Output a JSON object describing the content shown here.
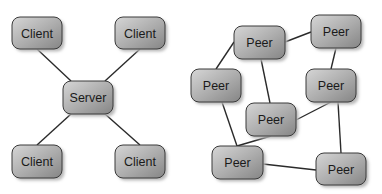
{
  "diagrams": [
    {
      "id": "client-server",
      "type": "star network",
      "nodes": [
        {
          "id": "client-tl",
          "label": "Client",
          "x": 12,
          "y": 17,
          "w": 50,
          "h": 32
        },
        {
          "id": "client-tr",
          "label": "Client",
          "x": 115,
          "y": 17,
          "w": 50,
          "h": 32
        },
        {
          "id": "server",
          "label": "Server",
          "x": 63,
          "y": 81,
          "w": 50,
          "h": 33
        },
        {
          "id": "client-bl",
          "label": "Client",
          "x": 12,
          "y": 145,
          "w": 50,
          "h": 33
        },
        {
          "id": "client-br",
          "label": "Client",
          "x": 115,
          "y": 145,
          "w": 50,
          "h": 33
        }
      ],
      "edges": [
        {
          "from": "client-tl",
          "to": "server",
          "x1": 37,
          "y1": 49,
          "x2": 71,
          "y2": 81
        },
        {
          "from": "client-tr",
          "to": "server",
          "x1": 140,
          "y1": 49,
          "x2": 105,
          "y2": 81
        },
        {
          "from": "server",
          "to": "client-bl",
          "x1": 71,
          "y1": 114,
          "x2": 37,
          "y2": 145
        },
        {
          "from": "server",
          "to": "client-br",
          "x1": 105,
          "y1": 114,
          "x2": 140,
          "y2": 145
        }
      ]
    },
    {
      "id": "peer-to-peer",
      "type": "mesh network",
      "nodes": [
        {
          "id": "peer-top",
          "label": "Peer",
          "x": 234,
          "y": 26,
          "w": 51,
          "h": 33
        },
        {
          "id": "peer-topright",
          "label": "Peer",
          "x": 311,
          "y": 15,
          "w": 50,
          "h": 33
        },
        {
          "id": "peer-midleft",
          "label": "Peer",
          "x": 191,
          "y": 69,
          "w": 50,
          "h": 33
        },
        {
          "id": "peer-midright",
          "label": "Peer",
          "x": 306,
          "y": 69,
          "w": 50,
          "h": 33
        },
        {
          "id": "peer-center",
          "label": "Peer",
          "x": 246,
          "y": 103,
          "w": 50,
          "h": 33
        },
        {
          "id": "peer-bottomleft",
          "label": "Peer",
          "x": 212,
          "y": 146,
          "w": 51,
          "h": 33
        },
        {
          "id": "peer-bottomright",
          "label": "Peer",
          "x": 316,
          "y": 153,
          "w": 50,
          "h": 32
        }
      ],
      "edges": [
        {
          "from": "peer-top",
          "to": "peer-topright",
          "x1": 285,
          "y1": 42,
          "x2": 311,
          "y2": 32
        },
        {
          "from": "peer-top",
          "to": "peer-midleft",
          "x1": 234,
          "y1": 42,
          "x2": 216,
          "y2": 69
        },
        {
          "from": "peer-top",
          "to": "peer-center",
          "x1": 261,
          "y1": 59,
          "x2": 270,
          "y2": 103
        },
        {
          "from": "peer-topright",
          "to": "peer-midright",
          "x1": 336,
          "y1": 48,
          "x2": 331,
          "y2": 69
        },
        {
          "from": "peer-midright",
          "to": "peer-center",
          "x1": 331,
          "y1": 102,
          "x2": 296,
          "y2": 120
        },
        {
          "from": "peer-midright",
          "to": "peer-bottomright",
          "x1": 338,
          "y1": 102,
          "x2": 341,
          "y2": 153
        },
        {
          "from": "peer-midleft",
          "to": "peer-bottomleft",
          "x1": 222,
          "y1": 102,
          "x2": 237,
          "y2": 146
        },
        {
          "from": "peer-center",
          "to": "peer-bottomleft",
          "x1": 271,
          "y1": 136,
          "x2": 237,
          "y2": 146
        },
        {
          "from": "peer-bottomleft",
          "to": "peer-bottomright",
          "x1": 263,
          "y1": 164,
          "x2": 316,
          "y2": 170
        }
      ]
    }
  ],
  "style": {
    "node_fill_light": "#d4d4d4",
    "node_fill_dark": "#8c8c8c",
    "node_stroke": "#3a3a3a",
    "shadow": "#b8b8b8",
    "edge_color": "#2a2a2a",
    "text_color": "#1a1a1a"
  }
}
